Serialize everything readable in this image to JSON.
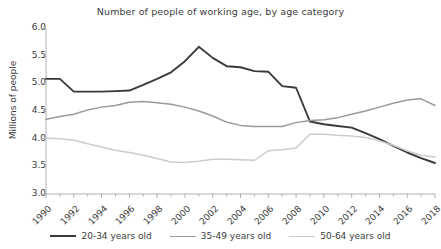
{
  "chart_data": {
    "type": "line",
    "title": "Number of people of working age, by age category",
    "xlabel": "",
    "ylabel": "Millions of people",
    "ylim": [
      3.0,
      6.0
    ],
    "xlim": [
      1990,
      2018
    ],
    "grid": false,
    "legend_position": "bottom",
    "ytick_labels": [
      "6.0",
      "5.5",
      "5.0",
      "4.5",
      "4.0",
      "3.5",
      "3.0"
    ],
    "ytick_values": [
      6.0,
      5.5,
      5.0,
      4.5,
      4.0,
      3.5,
      3.0
    ],
    "xtick_labels": [
      "1990",
      "1992",
      "1994",
      "1996",
      "1998",
      "2000",
      "2002",
      "2004",
      "2006",
      "2008",
      "2010",
      "2012",
      "2014",
      "2016",
      "2018"
    ],
    "xtick_values": [
      1990,
      1992,
      1994,
      1996,
      1998,
      2000,
      2002,
      2004,
      2006,
      2008,
      2010,
      2012,
      2014,
      2016,
      2018
    ],
    "x": [
      1990,
      1991,
      1992,
      1993,
      1994,
      1995,
      1996,
      1997,
      1998,
      1999,
      2000,
      2001,
      2002,
      2003,
      2004,
      2005,
      2006,
      2007,
      2008,
      2009,
      2010,
      2011,
      2012,
      2013,
      2014,
      2015,
      2016,
      2017,
      2018
    ],
    "series": [
      {
        "name": "20-34 years old",
        "color": "#3a3a3a",
        "width": 1.9,
        "values": [
          5.08,
          5.08,
          4.85,
          4.85,
          4.85,
          4.86,
          4.87,
          4.97,
          5.08,
          5.2,
          5.4,
          5.66,
          5.46,
          5.31,
          5.29,
          5.22,
          5.21,
          4.95,
          4.92,
          4.31,
          4.26,
          4.23,
          4.2,
          4.1,
          3.99,
          3.87,
          3.75,
          3.65,
          3.56
        ]
      },
      {
        "name": "35-49 years old",
        "color": "#9a9a9a",
        "width": 1.5,
        "values": [
          4.35,
          4.4,
          4.44,
          4.52,
          4.57,
          4.6,
          4.66,
          4.67,
          4.65,
          4.62,
          4.57,
          4.5,
          4.41,
          4.3,
          4.24,
          4.22,
          4.22,
          4.22,
          4.29,
          4.33,
          4.34,
          4.38,
          4.44,
          4.5,
          4.57,
          4.64,
          4.7,
          4.72,
          4.6
        ]
      },
      {
        "name": "50-64 years old",
        "color": "#cccccc",
        "width": 1.5,
        "values": [
          4.01,
          4.0,
          3.97,
          3.91,
          3.85,
          3.79,
          3.75,
          3.7,
          3.64,
          3.58,
          3.57,
          3.59,
          3.63,
          3.63,
          3.62,
          3.61,
          3.78,
          3.8,
          3.83,
          4.08,
          4.08,
          4.06,
          4.05,
          4.02,
          3.96,
          3.88,
          3.78,
          3.7,
          3.67
        ]
      }
    ]
  },
  "legend": {
    "items": [
      {
        "label": "20-34 years old",
        "color": "#3a3a3a",
        "width": "2px"
      },
      {
        "label": "35-49 years old",
        "color": "#9a9a9a",
        "width": "1.6px"
      },
      {
        "label": "50-64 years old",
        "color": "#cccccc",
        "width": "1.6px"
      }
    ]
  }
}
